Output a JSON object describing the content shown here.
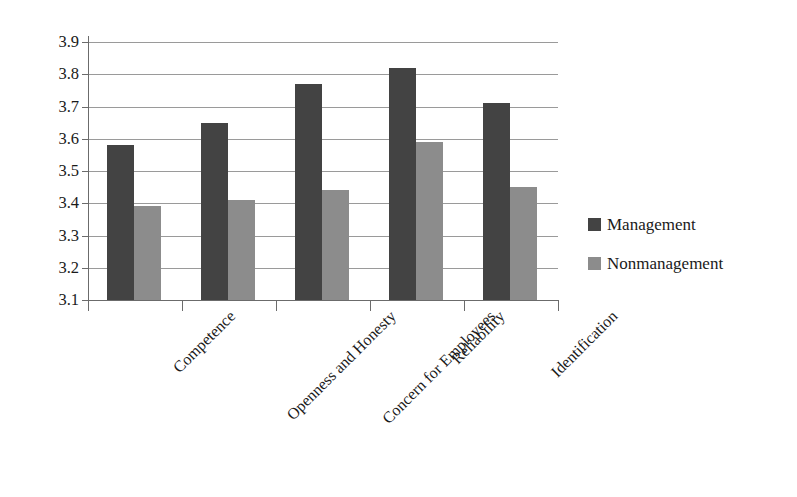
{
  "chart_data": {
    "type": "bar",
    "title": "",
    "subtitle": "",
    "xlabel": "",
    "ylabel": "",
    "ylim": [
      3.1,
      3.9
    ],
    "ytick_step": 0.1,
    "yticks": [
      "3.9",
      "3.8",
      "3.7",
      "3.6",
      "3.5",
      "3.4",
      "3.3",
      "3.2",
      "3.1"
    ],
    "grid": true,
    "legend_position": "right",
    "categories": [
      "Competence",
      "Openness and Honesty",
      "Concern for Employees",
      "Reliability",
      "Identification"
    ],
    "series": [
      {
        "name": "Management",
        "color": "#434343",
        "values": [
          3.58,
          3.65,
          3.77,
          3.82,
          3.71
        ]
      },
      {
        "name": "Nonmanagement",
        "color": "#8c8c8c",
        "values": [
          3.39,
          3.41,
          3.44,
          3.59,
          3.45
        ]
      }
    ]
  },
  "legend": {
    "items": [
      {
        "label": "Management",
        "swatch": "legend-swatch-dark"
      },
      {
        "label": "Nonmanagement",
        "swatch": "legend-swatch-light"
      }
    ]
  }
}
